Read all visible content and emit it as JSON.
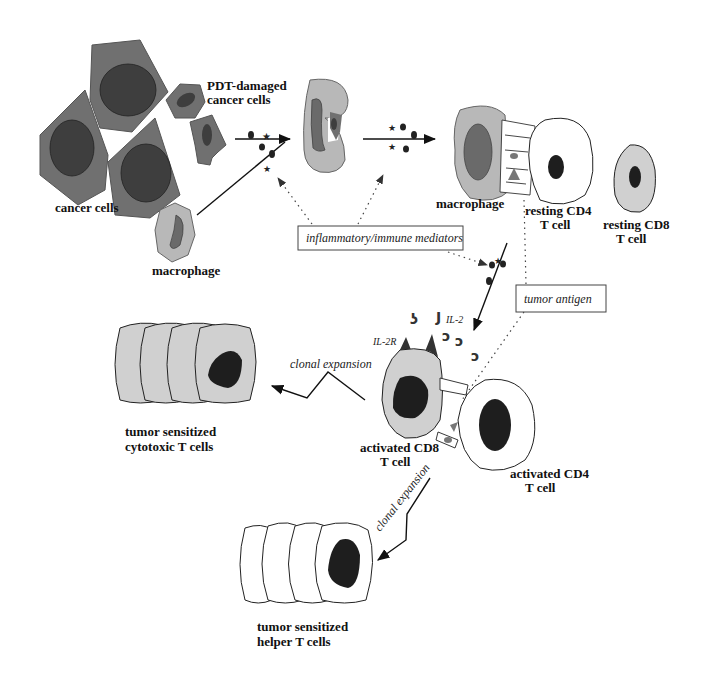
{
  "labels": {
    "cancer_cells": "cancer cells",
    "pdt_damaged_line1": "PDT-damaged",
    "pdt_damaged_line2": "cancer cells",
    "macrophage_1": "macrophage",
    "macrophage_2": "macrophage",
    "resting_cd4_line1": "resting CD4",
    "resting_cd4_line2": "T cell",
    "resting_cd8_line1": "resting CD8",
    "resting_cd8_line2": "T cell",
    "mediators_box": "inflammatory/immune mediators",
    "tumor_antigen_box": "tumor antigen",
    "il2": "IL-2",
    "il2r": "IL-2R",
    "clonal_expansion_1": "clonal expansion",
    "clonal_expansion_2": "clonal expansion",
    "activated_cd8_line1": "activated CD8",
    "activated_cd8_line2": "T cell",
    "activated_cd4_line1": "activated CD4",
    "activated_cd4_line2": "T cell",
    "cytotoxic_line1": "tumor sensitized",
    "cytotoxic_line2": "cytotoxic T cells",
    "helper_line1": "tumor sensitized",
    "helper_line2": "helper T cells"
  },
  "colors": {
    "cancer_cytoplasm": "#707070",
    "cancer_nucleus": "#3e3e3e",
    "macrophage_cytoplasm": "#b8b8b8",
    "macrophage_nucleus": "#6a6a6a",
    "tcell8_cytoplasm": "#d0d0d0",
    "nucleus_dark": "#1e1e1e",
    "white_cell": "#ffffff"
  }
}
